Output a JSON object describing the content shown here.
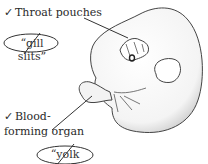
{
  "labels": {
    "throat": {
      "check": "✓",
      "text": "Throat pouches"
    },
    "gill": {
      "text": "“gill slits”",
      "struck": true
    },
    "blood_line1": {
      "check": "✓",
      "text": "Blood-"
    },
    "blood_line2": {
      "text": "forming organ"
    },
    "yolk": {
      "text": "“yolk sac”",
      "struck": true
    }
  }
}
